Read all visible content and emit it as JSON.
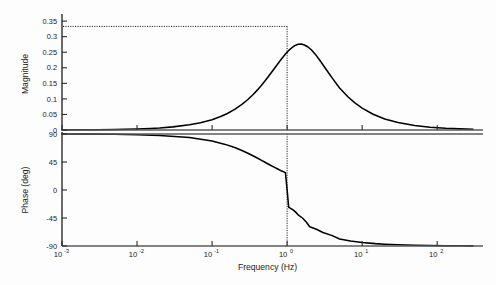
{
  "figure": {
    "background": "#fdfdfd",
    "width": 496,
    "height": 285,
    "curve_color": "#000000",
    "axis_color": "#2b2b2b",
    "zeroline_color": "#5a5a5a",
    "marker_color": "#000000"
  },
  "chart_data": [
    {
      "type": "line",
      "title": "",
      "subplot": "magnitude",
      "xlabel": "",
      "ylabel": "Magnitude",
      "xscale": "log",
      "xlim": [
        0.001,
        300
      ],
      "ylim": [
        0,
        0.36
      ],
      "xticks": [
        0.001,
        0.01,
        0.1,
        1,
        10,
        100
      ],
      "xticklabels": [
        "10-3",
        "10-2",
        "10-1",
        "100",
        "101",
        "102"
      ],
      "xtick_mantissa": [
        "10",
        "10",
        "10",
        "10",
        "10",
        "10"
      ],
      "xtick_exponent": [
        "-3",
        "-2",
        "-1",
        "0",
        "1",
        "2"
      ],
      "yticks": [
        0,
        0.05,
        0.1,
        0.15,
        0.2,
        0.25,
        0.3,
        0.35
      ],
      "yticklabels": [
        "0",
        "0.05",
        "0.1",
        "0.15",
        "0.2",
        "0.25",
        "0.3",
        "0.35"
      ],
      "grid": false,
      "legend": null,
      "annotations": [
        {
          "type": "hline",
          "value": 0.333,
          "style": "dotted",
          "label": "peak magnitude 0.333"
        },
        {
          "type": "vline",
          "value": 1,
          "style": "dotted",
          "label": "resonant frequency 1 Hz"
        },
        {
          "type": "hline",
          "value": 0,
          "style": "solid",
          "label": "zero baseline"
        }
      ],
      "series": [
        {
          "name": "Magnitude",
          "peak_value": 0.333,
          "peak_frequency": 1,
          "x": [
            0.001,
            0.0015,
            0.002,
            0.003,
            0.005,
            0.007,
            0.01,
            0.015,
            0.02,
            0.03,
            0.05,
            0.07,
            0.1,
            0.13,
            0.16,
            0.2,
            0.25,
            0.3,
            0.35,
            0.4,
            0.45,
            0.5,
            0.55,
            0.6,
            0.65,
            0.7,
            0.75,
            0.8,
            0.85,
            0.9,
            0.95,
            1.0,
            1.05,
            1.1,
            1.2,
            1.3,
            1.4,
            1.55,
            1.7,
            1.9,
            2.1,
            2.4,
            2.8,
            3.3,
            4.0,
            5.0,
            6.5,
            8.0,
            10.0,
            14.0,
            20.0,
            30.0,
            50.0,
            80.0,
            130.0,
            200.0,
            300.0
          ],
          "y": [
            0.00033,
            0.0005,
            0.00067,
            0.001,
            0.00167,
            0.00233,
            0.00333,
            0.005,
            0.00667,
            0.01,
            0.01666,
            0.02331,
            0.03328,
            0.04321,
            0.05309,
            0.06618,
            0.08229,
            0.09804,
            0.11333,
            0.12808,
            0.14223,
            0.15572,
            0.16852,
            0.18059,
            0.19192,
            0.20248,
            0.21228,
            0.22131,
            0.22959,
            0.23712,
            0.24392,
            0.25,
            0.25538,
            0.26008,
            0.26757,
            0.27262,
            0.27542,
            0.27621,
            0.27337,
            0.26682,
            0.25804,
            0.24224,
            0.22002,
            0.19517,
            0.16667,
            0.13514,
            0.10597,
            0.08696,
            0.07035,
            0.05051,
            0.03548,
            0.02375,
            0.01426,
            0.00892,
            0.00549,
            0.00357,
            0.00238
          ],
          "transfer_function": "H(s) = (s/wn) / (1 + s/wn)^2-like resonant bandpass, peak 0.333 at 1 Hz"
        }
      ]
    },
    {
      "type": "line",
      "title": "",
      "subplot": "phase",
      "xlabel": "Frequency (Hz)",
      "ylabel": "Phase (deg)",
      "xscale": "log",
      "xlim": [
        0.001,
        300
      ],
      "ylim": [
        -90,
        90
      ],
      "xticks": [
        0.001,
        0.01,
        0.1,
        1,
        10,
        100
      ],
      "xticklabels": [
        "10-3",
        "10-2",
        "10-1",
        "100",
        "101",
        "102"
      ],
      "xtick_mantissa": [
        "10",
        "10",
        "10",
        "10",
        "10",
        "10"
      ],
      "xtick_exponent": [
        "-3",
        "-2",
        "-1",
        "0",
        "1",
        "2"
      ],
      "yticks": [
        90,
        45,
        0,
        -45,
        -90
      ],
      "yticklabels": [
        "90",
        "45",
        "0",
        "-45",
        "-90"
      ],
      "grid": false,
      "legend": null,
      "annotations": [
        {
          "type": "vline",
          "value": 1,
          "style": "dotted",
          "label": "phase crossover 0 deg at 1 Hz"
        },
        {
          "type": "hline",
          "value": 90,
          "style": "solid",
          "label": "upper limit 90 deg"
        }
      ],
      "series": [
        {
          "name": "Phase",
          "x": [
            0.001,
            0.002,
            0.005,
            0.01,
            0.02,
            0.05,
            0.1,
            0.15,
            0.2,
            0.25,
            0.3,
            0.35,
            0.4,
            0.45,
            0.5,
            0.55,
            0.6,
            0.65,
            0.7,
            0.75,
            0.8,
            0.85,
            0.9,
            0.95,
            1.0,
            1.05,
            1.1,
            1.2,
            1.3,
            1.4,
            1.6,
            1.8,
            2.0,
            2.5,
            3.0,
            4.0,
            5.0,
            7.0,
            10.0,
            15.0,
            20.0,
            30.0,
            50.0,
            80.0,
            130.0,
            200.0,
            300.0
          ],
          "y": [
            89.89,
            89.77,
            89.43,
            88.85,
            87.71,
            84.29,
            78.69,
            73.3,
            68.2,
            63.43,
            59.04,
            55.01,
            51.34,
            48.01,
            45.0,
            42.27,
            39.81,
            37.57,
            35.54,
            33.69,
            32.01,
            30.47,
            29.05,
            27.76,
            0.0,
            -27.76,
            -29.05,
            -32.01,
            -35.54,
            -39.81,
            -45.0,
            -51.34,
            -59.04,
            -63.43,
            -68.2,
            -73.3,
            -78.69,
            -81.87,
            -84.29,
            -86.19,
            -87.14,
            -88.09,
            -88.85,
            -89.28,
            -89.56,
            -89.71,
            -89.81
          ],
          "phase_start_deg": 90,
          "phase_end_deg": -90,
          "crossover_frequency": 1
        }
      ]
    }
  ],
  "labels": {
    "magnitude_axis": "Magnitude",
    "phase_axis": "Phase (deg)",
    "frequency_axis": "Frequency (Hz)"
  }
}
